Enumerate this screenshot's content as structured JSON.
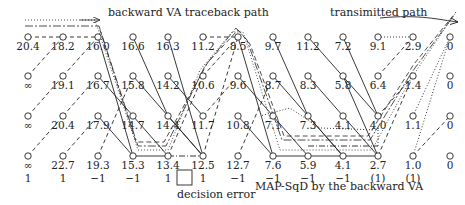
{
  "annotations": {
    "traceback_label": "backward VA traceback path",
    "transmitted_label": "transimitted path",
    "decision_error_label": "decision error",
    "map_label": "MAP-SqD by the backward VA"
  },
  "trellis": {
    "columns_x": [
      28,
      63,
      98,
      133,
      168,
      203,
      238,
      273,
      308,
      343,
      378,
      413,
      450
    ],
    "rows_y": [
      37,
      76,
      116,
      156
    ],
    "metrics": [
      [
        "20.4",
        "18.2",
        "16.0",
        "16.6",
        "16.3",
        "11.2",
        "8.5",
        "9.7",
        "11.2",
        "7.2",
        "9.1",
        "2.9",
        "0"
      ],
      [
        "∞",
        "19.1",
        "16.7",
        "15.8",
        "14.2",
        "10.6",
        "9.6",
        "8.7",
        "8.3",
        "5.8",
        "6.4",
        "1.4",
        "0"
      ],
      [
        "∞",
        "20.4",
        "17.9",
        "14.7",
        "14.4",
        "11.7",
        "10.8",
        "7.1",
        "7.3",
        "4.1",
        "4.0",
        "1.1",
        "0"
      ],
      [
        "∞",
        "22.7",
        "19.3",
        "15.3",
        "13.4",
        "12.5",
        "12.7",
        "7.6",
        "5.9",
        "4.1",
        "2.7",
        "1.0",
        "0"
      ]
    ]
  },
  "decisions": [
    "1",
    "1",
    "−1",
    "−1",
    "1",
    "1",
    "−1",
    "−1",
    "−1",
    "−1",
    "(1)",
    "(1)"
  ],
  "decision_error_index": 4,
  "colors": {
    "ink": "#222222",
    "background": "#ffffff"
  }
}
